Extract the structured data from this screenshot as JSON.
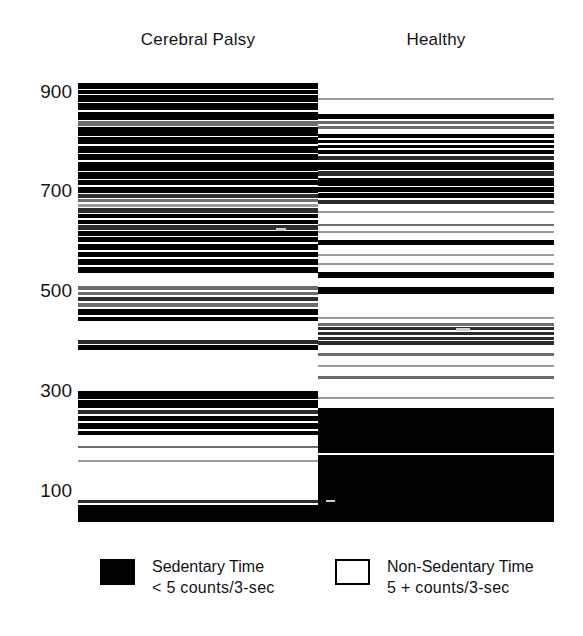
{
  "figure": {
    "type": "accelerometer-epoch-barcode-plot",
    "background": "#ffffff",
    "sedentary_color": "#000000",
    "nonsedentary_color": "#ffffff"
  },
  "columns": {
    "left_title": "Cerebral Palsy",
    "right_title": "Healthy"
  },
  "yaxis": {
    "ticks": [
      "900",
      "700",
      "500",
      "300",
      "100"
    ],
    "tick_values": [
      900,
      700,
      500,
      300,
      100
    ],
    "min": 60,
    "max": 940
  },
  "legend": {
    "sedentary": {
      "label": "Sedentary Time",
      "sublabel": "<  5  counts/3-sec",
      "swatch": "filled-black-square",
      "color": "#000000"
    },
    "nonsedentary": {
      "label": "Non-Sedentary Time",
      "sublabel": "5 +  counts/3-sec",
      "swatch": "empty-white-square",
      "color": "#ffffff"
    }
  },
  "chart_data": {
    "type": "heatmap",
    "title": "",
    "subtitle": "",
    "xlabel": "",
    "ylabel": "",
    "grid": false,
    "legend_position": "bottom",
    "axis_note": "y-axis = 3-second epoch number; black = sedentary epoch (<5 counts/3-sec), white = non-sedentary epoch (5+ counts/3-sec)",
    "ylim": [
      60,
      940
    ],
    "categories": [
      "Cerebral Palsy",
      "Healthy"
    ],
    "series": [
      {
        "name": "Cerebral Palsy",
        "encoding": "black-band spans in epoch units [start, end, intensity 0-1]",
        "bands": [
          [
            935,
            922,
            1.0
          ],
          [
            920,
            913,
            1.0
          ],
          [
            911,
            896,
            1.0
          ],
          [
            894,
            880,
            1.0
          ],
          [
            877,
            861,
            1.0
          ],
          [
            858,
            849,
            0.55
          ],
          [
            847,
            828,
            1.0
          ],
          [
            826,
            812,
            1.0
          ],
          [
            809,
            795,
            1.0
          ],
          [
            793,
            781,
            1.0
          ],
          [
            778,
            760,
            1.0
          ],
          [
            757,
            744,
            1.0
          ],
          [
            741,
            731,
            1.0
          ],
          [
            728,
            716,
            1.0
          ],
          [
            713,
            705,
            0.75
          ],
          [
            703,
            697,
            0.45
          ],
          [
            694,
            688,
            0.35
          ],
          [
            686,
            676,
            0.8
          ],
          [
            673,
            665,
            1.0
          ],
          [
            662,
            654,
            1.0
          ],
          [
            651,
            643,
            0.85
          ],
          [
            640,
            630,
            1.0
          ],
          [
            628,
            618,
            1.0
          ],
          [
            615,
            602,
            1.0
          ],
          [
            599,
            588,
            1.0
          ],
          [
            585,
            572,
            1.0
          ],
          [
            569,
            556,
            1.0
          ],
          [
            530,
            522,
            0.55
          ],
          [
            519,
            512,
            0.5
          ],
          [
            509,
            500,
            0.7
          ],
          [
            497,
            489,
            0.45
          ],
          [
            486,
            474,
            1.0
          ],
          [
            470,
            461,
            1.0
          ],
          [
            424,
            416,
            0.7
          ],
          [
            413,
            404,
            1.0
          ],
          [
            322,
            307,
            1.0
          ],
          [
            304,
            288,
            1.0
          ],
          [
            285,
            276,
            0.7
          ],
          [
            273,
            262,
            1.0
          ],
          [
            258,
            246,
            1.0
          ],
          [
            243,
            234,
            1.0
          ],
          [
            213,
            209,
            0.4
          ],
          [
            186,
            182,
            0.35
          ],
          [
            106,
            100,
            0.6
          ],
          [
            96,
            62,
            1.0
          ]
        ]
      },
      {
        "name": "Healthy",
        "encoding": "black-band spans in epoch units [start, end, intensity 0-1]",
        "bands": [
          [
            905,
            901,
            0.35
          ],
          [
            872,
            862,
            1.0
          ],
          [
            859,
            852,
            0.5
          ],
          [
            849,
            843,
            0.4
          ],
          [
            832,
            824,
            1.0
          ],
          [
            821,
            814,
            1.0
          ],
          [
            811,
            804,
            1.0
          ],
          [
            801,
            793,
            1.0
          ],
          [
            790,
            782,
            0.8
          ],
          [
            778,
            762,
            1.0
          ],
          [
            759,
            750,
            0.75
          ],
          [
            746,
            730,
            1.0
          ],
          [
            727,
            718,
            1.0
          ],
          [
            715,
            705,
            1.0
          ],
          [
            702,
            693,
            0.7
          ],
          [
            680,
            676,
            0.35
          ],
          [
            653,
            649,
            0.4
          ],
          [
            640,
            636,
            0.35
          ],
          [
            623,
            612,
            1.0
          ],
          [
            594,
            590,
            0.35
          ],
          [
            576,
            572,
            0.3
          ],
          [
            558,
            546,
            1.0
          ],
          [
            528,
            515,
            1.0
          ],
          [
            470,
            466,
            0.35
          ],
          [
            457,
            452,
            0.55
          ],
          [
            449,
            444,
            0.6
          ],
          [
            440,
            433,
            0.7
          ],
          [
            430,
            424,
            0.65
          ],
          [
            421,
            414,
            0.6
          ],
          [
            397,
            392,
            0.4
          ],
          [
            374,
            369,
            0.35
          ],
          [
            352,
            346,
            0.5
          ],
          [
            310,
            306,
            0.35
          ],
          [
            288,
            200,
            1.0
          ],
          [
            196,
            62,
            1.0
          ]
        ]
      }
    ]
  }
}
